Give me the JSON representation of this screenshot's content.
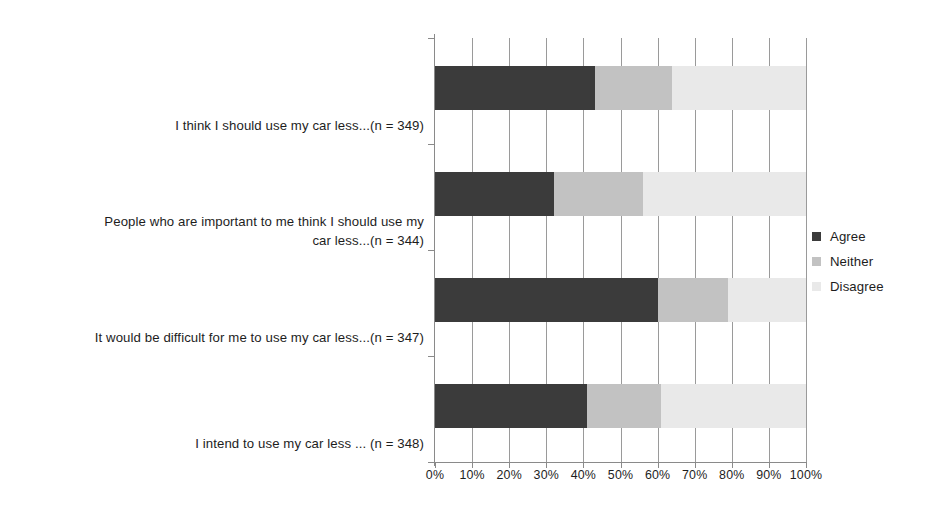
{
  "chart_data": {
    "type": "bar",
    "orientation": "horizontal",
    "stacked": true,
    "stack_normalized_percent": true,
    "title": "",
    "subtitle": "",
    "xlabel": "",
    "ylabel": "",
    "xlim": [
      0,
      100
    ],
    "xticks": [
      0,
      10,
      20,
      30,
      40,
      50,
      60,
      70,
      80,
      90,
      100
    ],
    "xticklabels": [
      "0%",
      "10%",
      "20%",
      "30%",
      "40%",
      "50%",
      "60%",
      "70%",
      "80%",
      "90%",
      "100%"
    ],
    "grid": "vertical",
    "legend_position": "right",
    "categories": [
      "I think I should use my car less...(n = 349)",
      "People who are important to me think I should use my\ncar less...(n = 344)",
      "It would be difficult for me to use my car less...(n = 347)",
      "I intend to use my car less ... (n = 348)"
    ],
    "series": [
      {
        "name": "Agree",
        "color": "#3b3b3b",
        "values": [
          43,
          32,
          60,
          41
        ]
      },
      {
        "name": "Neither",
        "color": "#c2c2c2",
        "values": [
          21,
          24,
          19,
          20
        ]
      },
      {
        "name": "Disagree",
        "color": "#e9e9e9",
        "values": [
          36,
          44,
          21,
          39
        ]
      }
    ]
  },
  "legend": {
    "items": [
      {
        "label": "Agree",
        "color": "#3b3b3b"
      },
      {
        "label": "Neither",
        "color": "#c2c2c2"
      },
      {
        "label": "Disagree",
        "color": "#e9e9e9"
      }
    ]
  }
}
